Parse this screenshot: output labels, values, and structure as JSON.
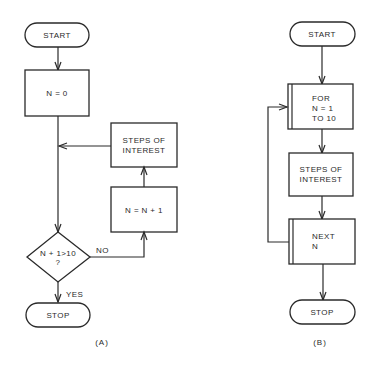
{
  "diagram_a": {
    "caption": "(A)",
    "start": "START",
    "init": "N = 0",
    "steps_line1": "STEPS OF",
    "steps_line2": "INTEREST",
    "increment": "N = N + 1",
    "decision_line1": "N + 1>10",
    "decision_line2": "?",
    "no_label": "NO",
    "yes_label": "YES",
    "stop": "STOP"
  },
  "diagram_b": {
    "caption": "(B)",
    "start": "START",
    "for_line1": "FOR",
    "for_line2": "N = 1",
    "for_line3": "TO 10",
    "steps_line1": "STEPS OF",
    "steps_line2": "INTEREST",
    "next_line1": "NEXT",
    "next_line2": "N",
    "stop": "STOP"
  }
}
